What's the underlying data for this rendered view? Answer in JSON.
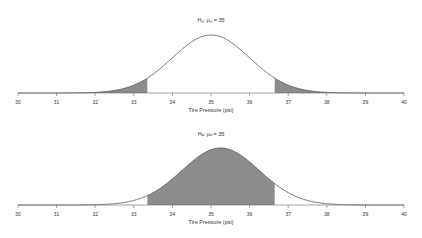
{
  "chart_data": [
    {
      "type": "area",
      "title": "H₀: μ₀ = 35",
      "xlabel": "Tire Pressure (psi)",
      "ylabel": "",
      "x_ticks": [
        30,
        31,
        32,
        33,
        34,
        35,
        36,
        37,
        38,
        39,
        40
      ],
      "xlim": [
        30,
        40
      ],
      "distribution": {
        "kind": "normal",
        "mean": 35,
        "sd": 1
      },
      "shaded_regions": [
        {
          "from": 30,
          "to": 33.35,
          "label": "left rejection tail"
        },
        {
          "from": 36.65,
          "to": 40,
          "label": "right rejection tail"
        }
      ],
      "grid": false,
      "fill_color": "#8c8c8c",
      "line_color": "#555555"
    },
    {
      "type": "area",
      "title": "Hₐ: μₐ = 35",
      "xlabel": "Tire Pressure (psi)",
      "ylabel": "",
      "x_ticks": [
        30,
        31,
        32,
        33,
        34,
        35,
        36,
        37,
        38,
        39,
        40
      ],
      "xlim": [
        30,
        40
      ],
      "distribution": {
        "kind": "normal",
        "mean": 35.25,
        "sd": 1
      },
      "shaded_regions": [
        {
          "from": 33.35,
          "to": 36.65,
          "label": "acceptance region (beta)"
        }
      ],
      "grid": false,
      "fill_color": "#8c8c8c",
      "line_color": "#555555"
    }
  ],
  "panels": [
    {
      "title": "H₀: μ₀ = 35",
      "xlabel": "Tire Pressure (psi)"
    },
    {
      "title": "Hₐ: μₐ = 35",
      "xlabel": "Tire Pressure (psi)"
    }
  ],
  "ticks": [
    "30",
    "31",
    "32",
    "33",
    "34",
    "35",
    "36",
    "37",
    "38",
    "39",
    "40"
  ]
}
